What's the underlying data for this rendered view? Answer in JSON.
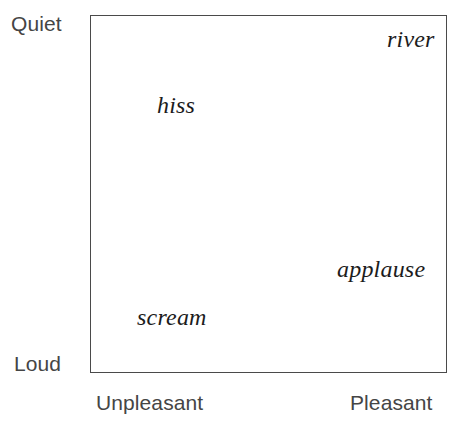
{
  "figure": {
    "type": "scatter-text-map",
    "background_color": "#ffffff",
    "frame_color": "#4a4a4a",
    "axis_label_color": "#454545",
    "point_label_color": "#1c1c1c"
  },
  "axes": {
    "y_top_label": "Quiet",
    "y_bottom_label": "Loud",
    "x_left_label": "Unpleasant",
    "x_right_label": "Pleasant"
  },
  "points": [
    {
      "label": "river"
    },
    {
      "label": "hiss"
    },
    {
      "label": "applause"
    },
    {
      "label": "scream"
    }
  ],
  "chart_data": {
    "type": "scatter",
    "title": "",
    "subtitle": "",
    "xlabel": "",
    "ylabel": "",
    "xlim": [
      0,
      1
    ],
    "ylim": [
      0,
      1
    ],
    "grid": false,
    "legend": "none",
    "x_axis": {
      "name": "Valence",
      "left_tick_label": "Unpleasant",
      "right_tick_label": "Pleasant",
      "tick_labels": [
        "Unpleasant",
        "Pleasant"
      ]
    },
    "y_axis": {
      "name": "Arousal",
      "top_tick_label": "Quiet",
      "bottom_tick_label": "Loud",
      "tick_labels": [
        "Quiet",
        "Loud"
      ]
    },
    "labels": [
      "river",
      "hiss",
      "applause",
      "scream"
    ],
    "x": [
      0.86,
      0.22,
      0.76,
      0.18
    ],
    "y": [
      0.94,
      0.76,
      0.31,
      0.18
    ],
    "points": [
      {
        "label": "river",
        "x": 0.86,
        "y": 0.94,
        "valence": "pleasant",
        "arousal": "quiet"
      },
      {
        "label": "hiss",
        "x": 0.22,
        "y": 0.76,
        "valence": "unpleasant",
        "arousal": "quiet"
      },
      {
        "label": "applause",
        "x": 0.76,
        "y": 0.31,
        "valence": "pleasant",
        "arousal": "loud"
      },
      {
        "label": "scream",
        "x": 0.18,
        "y": 0.18,
        "valence": "unpleasant",
        "arousal": "loud"
      }
    ],
    "annotations": [
      "river: quiet and pleasant (upper right)",
      "hiss: quiet and unpleasant (upper left)",
      "applause: loud and pleasant (lower right)",
      "scream: loud and unpleasant (lower left)"
    ]
  }
}
